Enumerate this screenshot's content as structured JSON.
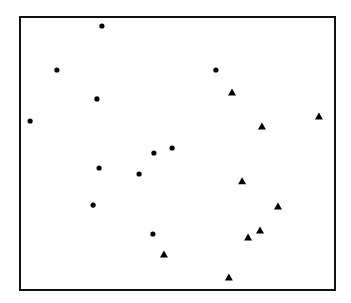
{
  "chart_data": {
    "type": "scatter",
    "title": "",
    "xlabel": "",
    "ylabel": "",
    "grid": false,
    "legend": null,
    "frame_px": {
      "left": 20,
      "top": 17,
      "right": 335,
      "bottom": 290
    },
    "xlim": [
      0,
      100
    ],
    "ylim": [
      0,
      100
    ],
    "series": [
      {
        "name": "circles",
        "marker": "circle",
        "color": "#000000",
        "points": [
          {
            "x": 26.0,
            "y": 96.7
          },
          {
            "x": 11.7,
            "y": 80.6
          },
          {
            "x": 24.4,
            "y": 70.0
          },
          {
            "x": 3.2,
            "y": 61.9
          },
          {
            "x": 62.2,
            "y": 80.6
          },
          {
            "x": 42.5,
            "y": 50.2
          },
          {
            "x": 48.3,
            "y": 52.0
          },
          {
            "x": 25.1,
            "y": 44.7
          },
          {
            "x": 37.8,
            "y": 42.5
          },
          {
            "x": 23.2,
            "y": 31.1
          },
          {
            "x": 42.2,
            "y": 20.5
          }
        ]
      },
      {
        "name": "triangles",
        "marker": "triangle",
        "color": "#000000",
        "points": [
          {
            "x": 67.3,
            "y": 72.5
          },
          {
            "x": 76.8,
            "y": 60.1
          },
          {
            "x": 94.9,
            "y": 63.7
          },
          {
            "x": 70.5,
            "y": 40.0
          },
          {
            "x": 81.9,
            "y": 30.8
          },
          {
            "x": 76.2,
            "y": 22.0
          },
          {
            "x": 72.4,
            "y": 19.4
          },
          {
            "x": 45.7,
            "y": 13.2
          },
          {
            "x": 66.3,
            "y": 4.8
          }
        ]
      }
    ]
  }
}
